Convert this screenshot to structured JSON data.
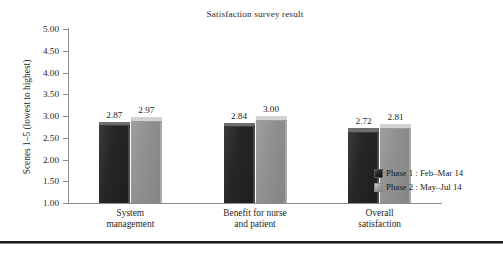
{
  "chart_data": {
    "type": "bar",
    "title": "Satisfaction survey result",
    "xlabel": "",
    "ylabel": "Scenes 1–5 (lowest to highest)",
    "ylim": [
      1.0,
      5.0
    ],
    "ytick_step": 0.5,
    "ytick_labels": [
      "5.00",
      "4.50",
      "4.00",
      "3.50",
      "3.00",
      "2.50",
      "2.00",
      "1.50",
      "1.00"
    ],
    "ytick_values": [
      5.0,
      4.5,
      4.0,
      3.5,
      3.0,
      2.5,
      2.0,
      1.5,
      1.0
    ],
    "grid": false,
    "legend_position": "right",
    "categories": [
      "System management",
      "Benefit for nurse and patient",
      "Overall satisfaction"
    ],
    "category_lines": [
      [
        "System",
        "management"
      ],
      [
        "Benefit for nurse",
        "and patient"
      ],
      [
        "Overall",
        "satisfaction"
      ]
    ],
    "series": [
      {
        "name": "Phase 1 : Feb–Mar 14",
        "color": "#262626",
        "values": [
          2.87,
          2.84,
          2.72
        ],
        "value_labels": [
          "2.87",
          "2.84",
          "2.72"
        ]
      },
      {
        "name": "Phase 2 : May–Jul 14",
        "color": "#909090",
        "values": [
          2.97,
          3.0,
          2.81
        ],
        "value_labels": [
          "2.97",
          "3.00",
          "2.81"
        ]
      }
    ]
  },
  "legend": {
    "items": [
      {
        "label": "Phase 1 : Feb–Mar 14",
        "swatch": "series-dark"
      },
      {
        "label": "Phase 2 : May–Jul 14",
        "swatch": "series-light"
      }
    ]
  },
  "colors": {
    "series_1": "#262626",
    "series_2": "#909090",
    "axis": "#8c8c8c",
    "text": "#1a1a1a",
    "rule": "#1a1a1a",
    "background": "#ffffff"
  }
}
